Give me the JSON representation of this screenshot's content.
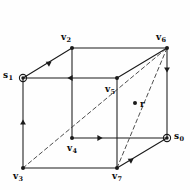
{
  "figure": {
    "background": "#fefefe",
    "line_color": "#1a1a1a",
    "dash_color": "#3a3a3a"
  },
  "vertices": [
    {
      "id": "v2",
      "label": "v",
      "sub": "2",
      "x": 72,
      "y": 48,
      "marker": "dot",
      "label_x": 61,
      "label_y": 33
    },
    {
      "id": "v6",
      "label": "v",
      "sub": "6",
      "x": 167,
      "y": 48,
      "marker": "dot",
      "label_x": 156,
      "label_y": 33
    },
    {
      "id": "s1",
      "label": "s",
      "sub": "1",
      "x": 23,
      "y": 78,
      "marker": "circled",
      "label_x": 3,
      "label_y": 71
    },
    {
      "id": "v5",
      "label": "v",
      "sub": "5",
      "x": 117,
      "y": 78,
      "marker": "dot",
      "label_x": 105,
      "label_y": 85
    },
    {
      "id": "r",
      "label": "r",
      "sub": "",
      "x": 135,
      "y": 103,
      "marker": "dot",
      "label_x": 140,
      "label_y": 100
    },
    {
      "id": "v4",
      "label": "v",
      "sub": "4",
      "x": 72,
      "y": 138,
      "marker": "dot",
      "label_x": 67,
      "label_y": 144
    },
    {
      "id": "s0",
      "label": "s",
      "sub": "0",
      "x": 167,
      "y": 138,
      "marker": "circled",
      "label_x": 174,
      "label_y": 132
    },
    {
      "id": "v3",
      "label": "v",
      "sub": "3",
      "x": 23,
      "y": 168,
      "marker": "dot",
      "label_x": 13,
      "label_y": 172
    },
    {
      "id": "v7",
      "label": "v",
      "sub": "7",
      "x": 117,
      "y": 168,
      "marker": "dot",
      "label_x": 112,
      "label_y": 172
    }
  ],
  "edges": [
    {
      "id": "v2-v6",
      "from": "v2",
      "to": "v6",
      "style": "solid",
      "arrow": "none"
    },
    {
      "id": "v2-s1",
      "from": "v2",
      "to": "s1",
      "style": "solid",
      "arrow": "forward"
    },
    {
      "id": "v2-v4",
      "from": "v2",
      "to": "v4",
      "style": "solid",
      "arrow": "none"
    },
    {
      "id": "v6-s0",
      "from": "v6",
      "to": "s0",
      "style": "solid",
      "arrow": "forward"
    },
    {
      "id": "v6-v5",
      "from": "v6",
      "to": "v5",
      "style": "solid",
      "arrow": "none"
    },
    {
      "id": "s1-v5",
      "from": "v5",
      "to": "s1",
      "style": "solid",
      "arrow": "forward"
    },
    {
      "id": "s1-v3",
      "from": "v3",
      "to": "s1",
      "style": "solid",
      "arrow": "forward"
    },
    {
      "id": "v5-v7",
      "from": "v5",
      "to": "v7",
      "style": "solid",
      "arrow": "none"
    },
    {
      "id": "v4-s0",
      "from": "v4",
      "to": "s0",
      "style": "solid",
      "arrow": "forward"
    },
    {
      "id": "v3-v7",
      "from": "v3",
      "to": "v7",
      "style": "solid",
      "arrow": "none"
    },
    {
      "id": "s0-v7",
      "from": "s0",
      "to": "v7",
      "style": "solid",
      "arrow": "forward"
    },
    {
      "id": "r-vert",
      "from": "v6",
      "to": "v7",
      "style": "dashed",
      "arrow": "none"
    },
    {
      "id": "r-diag",
      "from": "v3",
      "to": "v6",
      "style": "dashed",
      "arrow": "none"
    }
  ],
  "arrow_marks": [
    {
      "id": "arrow-v2-s1",
      "x": 48,
      "y": 63,
      "dir": "down-left"
    },
    {
      "id": "arrow-v5-s1",
      "x": 70,
      "y": 78,
      "dir": "left"
    },
    {
      "id": "arrow-v3-s1",
      "x": 23,
      "y": 122,
      "dir": "up"
    },
    {
      "id": "arrow-v6-s0",
      "x": 167,
      "y": 70,
      "dir": "down"
    },
    {
      "id": "arrow-v4-s0",
      "x": 100,
      "y": 138,
      "dir": "right"
    },
    {
      "id": "arrow-s0-v7",
      "x": 130,
      "y": 160,
      "dir": "down-left"
    }
  ]
}
